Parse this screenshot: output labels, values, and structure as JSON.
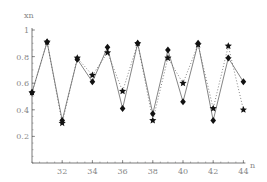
{
  "chart_data": {
    "type": "line",
    "title": "",
    "xlabel": "n",
    "ylabel": "xn",
    "xlim": [
      30,
      44
    ],
    "ylim": [
      0,
      1
    ],
    "grid": false,
    "legend": "none",
    "x_ticks": [
      32,
      34,
      36,
      38,
      40,
      42,
      44
    ],
    "y_ticks": [
      0.2,
      0.4,
      0.6,
      0.8,
      1
    ],
    "y_tick_labels": [
      "0.2",
      "0.4",
      "0.6",
      "0.8",
      "1"
    ],
    "x": [
      30,
      31,
      32,
      33,
      34,
      35,
      36,
      37,
      38,
      39,
      40,
      41,
      42,
      43,
      44
    ],
    "series": [
      {
        "name": "diamond (solid)",
        "marker": "diamond",
        "line": "solid",
        "values": [
          0.53,
          0.91,
          0.32,
          0.78,
          0.61,
          0.87,
          0.41,
          0.9,
          0.37,
          0.85,
          0.46,
          0.9,
          0.32,
          0.79,
          0.61
        ]
      },
      {
        "name": "star (dotted)",
        "marker": "star",
        "line": "dotted",
        "values": [
          0.53,
          0.91,
          0.3,
          0.79,
          0.66,
          0.83,
          0.54,
          0.9,
          0.32,
          0.79,
          0.6,
          0.89,
          0.41,
          0.88,
          0.4
        ]
      }
    ]
  },
  "colors": {
    "axis": "#555555",
    "line": "#666666",
    "marker": "#111111",
    "text": "#888888"
  }
}
